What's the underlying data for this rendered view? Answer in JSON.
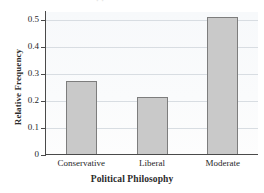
{
  "chart_data": {
    "type": "bar",
    "title": "",
    "categories": [
      "Conservative",
      "Liberal",
      "Moderate"
    ],
    "values": [
      0.275,
      0.215,
      0.51
    ],
    "xlabel": "Political Philosophy",
    "ylabel": "Relative Frequency",
    "ylim": [
      0,
      0.53
    ],
    "yticks": [
      0,
      0.1,
      0.2,
      0.3,
      0.4,
      0.5
    ],
    "ytick_labels": [
      "0",
      "0.1",
      "0.2",
      "0.3",
      "0.4",
      "0.5"
    ],
    "grid": "horizontal",
    "legend": "none",
    "bar_fill_color": "#c9c9c9",
    "bar_border_color": "#7d7d7d",
    "gridline_color": "#d8dde2",
    "axis_color": "#4a4a4a",
    "plot_background": "#fafbfc"
  },
  "title_remnant": "· ·"
}
